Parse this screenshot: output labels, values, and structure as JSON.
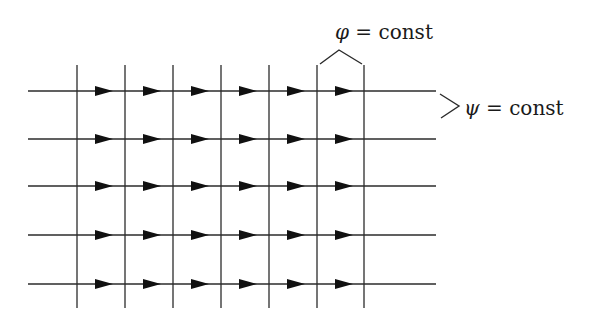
{
  "diagram": {
    "line_color": "#2b2b2b",
    "arrow_color": "#111111",
    "grid": {
      "vertical_lines_x": [
        77,
        125,
        173,
        221,
        269,
        317,
        364
      ],
      "vertical_y_range": [
        65,
        308
      ],
      "horizontal_lines_y": [
        91,
        139,
        186,
        235,
        284
      ],
      "horizontal_x_range": [
        28,
        436
      ],
      "arrow_tips_x": [
        113,
        161,
        209,
        257,
        305,
        353
      ],
      "arrow_length": 18,
      "arrow_half_height": 5,
      "arrow_direction": "right"
    },
    "labels": {
      "phi": {
        "symbol": "φ",
        "rest": " = const",
        "x": 335,
        "y": 22,
        "refers_to": "vertical lines"
      },
      "psi": {
        "symbol": "ψ",
        "rest": " = const",
        "x": 464,
        "y": 98,
        "refers_to": "horizontal lines"
      }
    },
    "braces": {
      "phi": [
        [
          320,
          64
        ],
        [
          339,
          50
        ],
        [
          362,
          64
        ]
      ],
      "psi": [
        [
          440,
          94
        ],
        [
          459,
          106
        ],
        [
          441,
          118
        ]
      ]
    }
  }
}
